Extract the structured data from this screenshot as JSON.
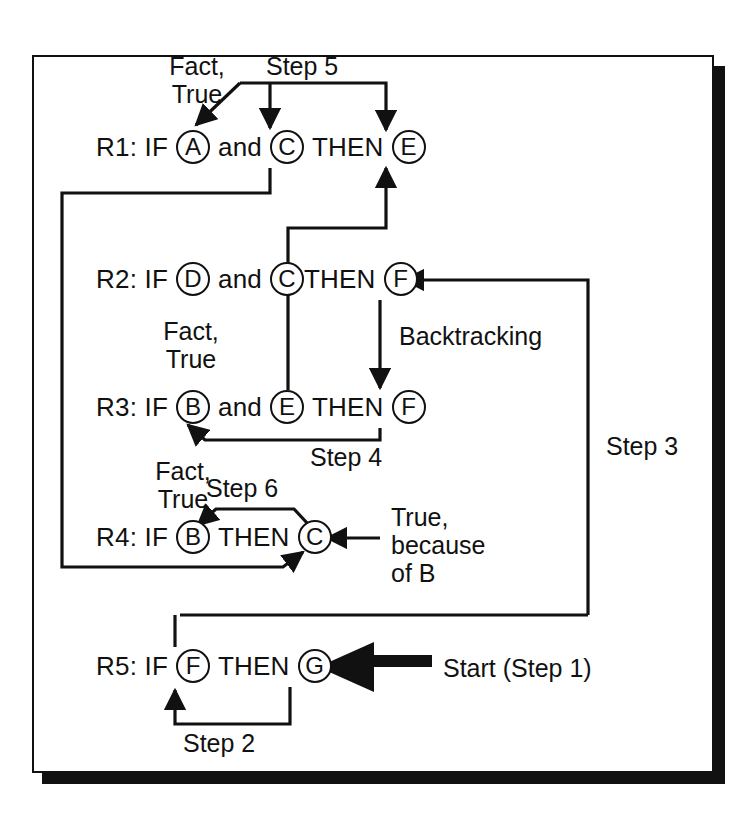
{
  "diagram": {
    "colors": {
      "ink": "#111111",
      "paper": "#ffffff"
    },
    "rules": [
      {
        "id": "R1",
        "prefix": "R1: IF",
        "nodes": [
          "A",
          "C",
          "E"
        ],
        "connector": "and",
        "then": "THEN"
      },
      {
        "id": "R2",
        "prefix": "R2: IF",
        "nodes": [
          "D",
          "C",
          "F"
        ],
        "connector": "and",
        "then": "THEN"
      },
      {
        "id": "R3",
        "prefix": "R3: IF",
        "nodes": [
          "B",
          "E",
          "F"
        ],
        "connector": "and",
        "then": "THEN"
      },
      {
        "id": "R4",
        "prefix": "R4: IF",
        "nodes": [
          "B",
          "C"
        ],
        "connector": "",
        "then": "THEN"
      },
      {
        "id": "R5",
        "prefix": "R5: IF",
        "nodes": [
          "F",
          "G"
        ],
        "connector": "",
        "then": "THEN"
      }
    ],
    "labels": {
      "fact_true_1": "Fact,\nTrue",
      "fact_true_2": "Fact,\nTrue",
      "fact_true_3": "Fact,\nTrue",
      "step5": "Step 5",
      "step4": "Step 4",
      "step3": "Step 3",
      "step2": "Step 2",
      "step6": "Step 6",
      "backtracking": "Backtracking",
      "true_because_of_b": "True,\nbecause\nof B",
      "start": "Start (Step 1)"
    }
  },
  "chart_data": {
    "type": "diagram",
    "nodes": [
      "A",
      "B",
      "C",
      "D",
      "E",
      "F",
      "G"
    ],
    "rules": [
      "R1: IF A and C THEN E",
      "R2: IF D and C THEN F",
      "R3: IF B and E THEN F",
      "R4: IF B THEN C",
      "R5: IF F THEN G"
    ],
    "annotations": [
      "Start (Step 1)",
      "Step 2",
      "Step 3",
      "Step 4",
      "Step 5",
      "Step 6",
      "Backtracking",
      "Fact, True",
      "True, because of B"
    ]
  }
}
